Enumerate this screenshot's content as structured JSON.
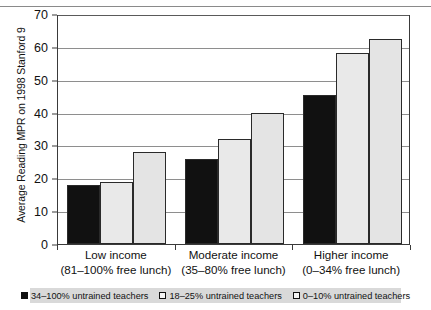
{
  "chart_data": {
    "type": "bar",
    "title": "",
    "xlabel": "",
    "ylabel": "Average Reading MPR on 1998 Stanford 9",
    "ylim": [
      0,
      70
    ],
    "ytick_step": 10,
    "yticks": [
      0,
      10,
      20,
      30,
      40,
      50,
      60,
      70
    ],
    "grid": true,
    "legend_position": "bottom",
    "categories": [
      "Low income",
      "Moderate income",
      "Higher income"
    ],
    "category_sublabels": [
      "(81–100% free lunch)",
      "(35–80% free lunch)",
      "(0–34% free lunch)"
    ],
    "series": [
      {
        "name": "34–100% untrained teachers",
        "color": "#111111",
        "values": [
          18,
          26,
          45.5
        ]
      },
      {
        "name": "18–25% untrained teachers",
        "color": "#e9e9e9",
        "values": [
          19,
          32,
          58
        ]
      },
      {
        "name": "0–10% untrained teachers",
        "color": "#e4e4e4",
        "values": [
          28,
          40,
          62.5
        ]
      }
    ]
  },
  "axis": {
    "y_title": "Average Reading MPR on 1998 Stanford 9",
    "y_tick_labels": [
      "70",
      "60",
      "50",
      "40",
      "30",
      "20",
      "10",
      "0"
    ]
  },
  "legend": {
    "items": [
      {
        "label": "34–100% untrained teachers",
        "swatch": "black-square"
      },
      {
        "label": "18–25% untrained teachers",
        "swatch": "white-square"
      },
      {
        "label": "0–10% untrained teachers",
        "swatch": "white-square"
      }
    ]
  }
}
